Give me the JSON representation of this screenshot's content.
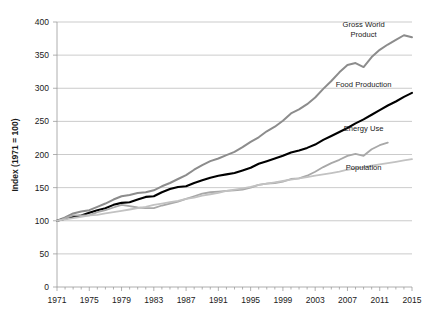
{
  "chart_data": {
    "type": "line",
    "title": "",
    "xlabel": "",
    "ylabel": "Index (1971 = 100)",
    "xlim": [
      1971,
      2015
    ],
    "ylim": [
      0,
      400
    ],
    "ytick_labels": [
      "0",
      "50",
      "100",
      "150",
      "200",
      "250",
      "300",
      "350",
      "400"
    ],
    "ytick_values": [
      0,
      50,
      100,
      150,
      200,
      250,
      300,
      350,
      400
    ],
    "xtick_labels": [
      "1971",
      "1975",
      "1979",
      "1983",
      "1987",
      "1991",
      "1995",
      "1999",
      "2003",
      "2007",
      "2011",
      "2015"
    ],
    "xtick_values": [
      1971,
      1975,
      1979,
      1983,
      1987,
      1991,
      1995,
      1999,
      2003,
      2007,
      2011,
      2015
    ],
    "grid": "horizontal",
    "legend_position": "inline-right-labels",
    "x": [
      1971,
      1972,
      1973,
      1974,
      1975,
      1976,
      1977,
      1978,
      1979,
      1980,
      1981,
      1982,
      1983,
      1984,
      1985,
      1986,
      1987,
      1988,
      1989,
      1990,
      1991,
      1992,
      1993,
      1994,
      1995,
      1996,
      1997,
      1998,
      1999,
      2000,
      2001,
      2002,
      2003,
      2004,
      2005,
      2006,
      2007,
      2008,
      2009,
      2010,
      2011,
      2012,
      2013,
      2014,
      2015
    ],
    "series": [
      {
        "name": "Gross World Product",
        "color": "#8c8c8c",
        "width": 2.0,
        "label_x": 2009,
        "label_y": 392,
        "values": [
          100,
          105,
          111,
          114,
          116,
          121,
          126,
          132,
          137,
          139,
          142,
          143,
          146,
          152,
          157,
          163,
          169,
          177,
          184,
          190,
          194,
          199,
          204,
          211,
          219,
          226,
          235,
          242,
          251,
          262,
          268,
          276,
          286,
          299,
          311,
          324,
          335,
          338,
          332,
          347,
          358,
          366,
          373,
          380,
          377
        ]
      },
      {
        "name": "Food Production",
        "color": "#000000",
        "width": 2.1,
        "label_x": 2009,
        "label_y": 302,
        "values": [
          100,
          103,
          106,
          108,
          112,
          116,
          119,
          124,
          127,
          128,
          132,
          136,
          137,
          143,
          148,
          151,
          152,
          157,
          161,
          165,
          168,
          170,
          172,
          176,
          180,
          186,
          190,
          194,
          198,
          203,
          206,
          210,
          215,
          222,
          228,
          234,
          240,
          247,
          253,
          260,
          267,
          274,
          280,
          287,
          293
        ]
      },
      {
        "name": "Energy Use",
        "color": "#a8a8a8",
        "width": 1.8,
        "label_x": 2009,
        "label_y": 236,
        "values": [
          100,
          104,
          108,
          108,
          108,
          113,
          116,
          120,
          124,
          122,
          120,
          119,
          119,
          123,
          126,
          129,
          133,
          137,
          141,
          143,
          144,
          145,
          146,
          147,
          150,
          154,
          156,
          157,
          159,
          163,
          164,
          168,
          174,
          181,
          187,
          192,
          198,
          201,
          198,
          208,
          214,
          218,
          null,
          null,
          null
        ]
      },
      {
        "name": "Population",
        "color": "#c2c2c2",
        "width": 1.8,
        "label_x": 2009,
        "label_y": 176,
        "values": [
          100,
          102,
          104,
          106,
          108,
          109,
          111,
          113,
          115,
          117,
          119,
          121,
          124,
          126,
          128,
          130,
          133,
          135,
          138,
          140,
          142,
          145,
          147,
          149,
          151,
          154,
          156,
          158,
          160,
          162,
          164,
          166,
          168,
          170,
          172,
          174,
          177,
          179,
          181,
          183,
          185,
          187,
          189,
          191,
          193
        ]
      }
    ]
  }
}
